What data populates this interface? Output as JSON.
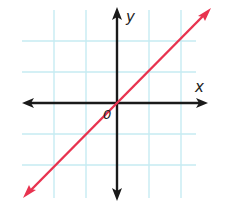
{
  "graph": {
    "axis_labels": {
      "x": "x",
      "y": "y",
      "origin": "0"
    },
    "description": "Line through the origin with positive slope (y = x) on a coordinate grid",
    "line": {
      "equation": "y = x",
      "slope": 1,
      "intercept": 0,
      "through": [
        [
          -3,
          -3
        ],
        [
          0,
          0
        ],
        [
          3,
          3
        ]
      ]
    },
    "grid": {
      "x_min": -3,
      "x_max": 3,
      "y_min": -3,
      "y_max": 3,
      "step": 1
    },
    "colors": {
      "grid": "#c6ebf2",
      "axes": "#1a1a1a",
      "line": "#e8334f",
      "background": "#ffffff"
    }
  }
}
